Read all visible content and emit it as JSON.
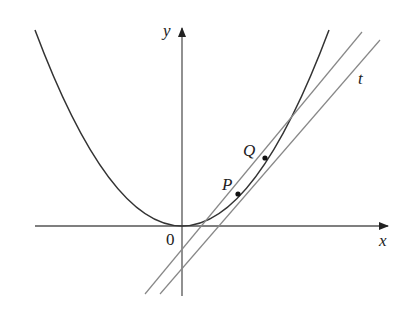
{
  "figure": {
    "labels": {
      "x_axis": "x",
      "y_axis": "y",
      "origin": "0",
      "point_p": "P",
      "point_q": "Q",
      "tangent": "t"
    },
    "colors": {
      "curve": "#333333",
      "axis": "#555555",
      "lines": "#888888",
      "points": "#111111"
    }
  }
}
